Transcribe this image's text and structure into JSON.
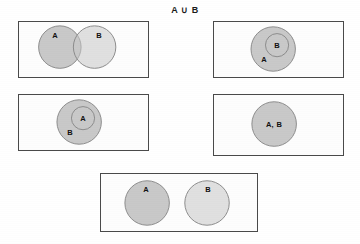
{
  "diagram": {
    "title": "A ∪ B",
    "type": "venn-diagram-set",
    "colors": {
      "circle_fill": "#c9c9c9",
      "circle_stroke": "#8a8a8a",
      "panel_border": "#4a4a4a",
      "background": "#ffffff",
      "label_text": "#111111"
    },
    "panels": [
      {
        "id": "panel-overlapping",
        "description": "Two partially overlapping circles",
        "rect": {
          "x": 18,
          "y": 21,
          "w": 131,
          "h": 57
        },
        "circles": [
          {
            "name": "A",
            "cx": 59,
            "cy": 47,
            "r": 22
          },
          {
            "name": "B",
            "cx": 95,
            "cy": 47,
            "r": 22
          }
        ],
        "labels": [
          {
            "text": "A",
            "x": 55,
            "y": 35
          },
          {
            "text": "B",
            "x": 99,
            "y": 35
          }
        ]
      },
      {
        "id": "panel-b-inside-a",
        "description": "Circle B nested inside circle A",
        "rect": {
          "x": 213,
          "y": 21,
          "w": 131,
          "h": 57
        },
        "circles": [
          {
            "name": "A",
            "cx": 273,
            "cy": 49,
            "r": 23
          },
          {
            "name": "B",
            "cx": 277,
            "cy": 45,
            "r": 12
          }
        ],
        "labels": [
          {
            "text": "B",
            "x": 277,
            "y": 45
          },
          {
            "text": "A",
            "x": 264,
            "y": 59
          }
        ]
      },
      {
        "id": "panel-a-inside-b",
        "description": "Circle A nested inside circle B",
        "rect": {
          "x": 18,
          "y": 94,
          "w": 131,
          "h": 57
        },
        "circles": [
          {
            "name": "B",
            "cx": 79,
            "cy": 122,
            "r": 23
          },
          {
            "name": "A",
            "cx": 83,
            "cy": 118,
            "r": 12
          }
        ],
        "labels": [
          {
            "text": "A",
            "x": 83,
            "y": 118
          },
          {
            "text": "B",
            "x": 70,
            "y": 132
          }
        ]
      },
      {
        "id": "panel-identical",
        "description": "Single circle representing identical sets A and B",
        "rect": {
          "x": 213,
          "y": 94,
          "w": 131,
          "h": 62
        },
        "circles": [
          {
            "name": "A,B",
            "cx": 274,
            "cy": 124,
            "r": 23
          }
        ],
        "labels": [
          {
            "text": "A, B",
            "x": 274,
            "y": 124
          }
        ]
      },
      {
        "id": "panel-disjoint",
        "description": "Two separate non-overlapping circles",
        "rect": {
          "x": 100,
          "y": 173,
          "w": 158,
          "h": 59
        },
        "circles": [
          {
            "name": "A",
            "cx": 146,
            "cy": 203,
            "r": 23
          },
          {
            "name": "B",
            "cx": 208,
            "cy": 203,
            "r": 23
          }
        ],
        "labels": [
          {
            "text": "A",
            "x": 146,
            "y": 189
          },
          {
            "text": "B",
            "x": 208,
            "y": 189
          }
        ]
      }
    ]
  }
}
